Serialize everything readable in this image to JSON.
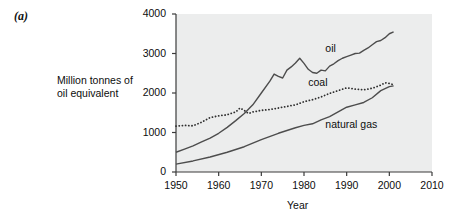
{
  "figure": {
    "panel_letter": "(a)",
    "y_axis_title_line1": "Million tonnes of",
    "y_axis_title_line2": "oil equivalent",
    "x_axis_title": "Year"
  },
  "chart_data": {
    "type": "line",
    "title": "",
    "xlabel": "Year",
    "ylabel": "Million tonnes of oil equivalent",
    "xlim": [
      1950,
      2010
    ],
    "ylim": [
      0,
      4000
    ],
    "xticks": [
      "1950",
      "1960",
      "1970",
      "1980",
      "1990",
      "2000",
      "2010"
    ],
    "yticks": [
      "0",
      "1000",
      "2000",
      "3000",
      "4000"
    ],
    "grid": false,
    "legend_position": "inline-labels",
    "plot_background": "#eceded",
    "series": [
      {
        "name": "oil",
        "label": "oil",
        "style": "solid",
        "color": "#4d4d4d",
        "x": [
          1950,
          1952,
          1954,
          1956,
          1958,
          1960,
          1962,
          1964,
          1966,
          1968,
          1970,
          1972,
          1973,
          1974,
          1975,
          1976,
          1977,
          1978,
          1979,
          1980,
          1981,
          1982,
          1983,
          1984,
          1985,
          1986,
          1987,
          1988,
          1989,
          1990,
          1991,
          1992,
          1993,
          1994,
          1995,
          1996,
          1997,
          1998,
          1999,
          2000,
          2001
        ],
        "values": [
          500,
          580,
          660,
          760,
          860,
          980,
          1130,
          1300,
          1480,
          1700,
          2000,
          2300,
          2480,
          2420,
          2380,
          2580,
          2660,
          2760,
          2880,
          2750,
          2600,
          2520,
          2500,
          2580,
          2560,
          2680,
          2740,
          2820,
          2880,
          2920,
          2960,
          3000,
          3010,
          3080,
          3140,
          3220,
          3300,
          3330,
          3400,
          3500,
          3550
        ]
      },
      {
        "name": "coal",
        "label": "coal",
        "style": "dotted",
        "color": "#2f2f2f",
        "x": [
          1950,
          1952,
          1954,
          1956,
          1958,
          1960,
          1962,
          1964,
          1965,
          1966,
          1967,
          1968,
          1970,
          1972,
          1974,
          1976,
          1978,
          1980,
          1982,
          1984,
          1986,
          1988,
          1990,
          1992,
          1994,
          1996,
          1998,
          1999,
          2000,
          2001
        ],
        "values": [
          1160,
          1180,
          1170,
          1260,
          1380,
          1420,
          1450,
          1520,
          1620,
          1560,
          1480,
          1520,
          1560,
          1580,
          1620,
          1660,
          1700,
          1780,
          1830,
          1900,
          1990,
          2060,
          2130,
          2100,
          2080,
          2120,
          2200,
          2260,
          2240,
          2210
        ]
      },
      {
        "name": "natural gas",
        "label": "natural gas",
        "style": "solid",
        "color": "#4d4d4d",
        "x": [
          1950,
          1954,
          1958,
          1962,
          1966,
          1970,
          1974,
          1978,
          1980,
          1982,
          1984,
          1986,
          1988,
          1990,
          1992,
          1994,
          1996,
          1998,
          2000,
          2001
        ],
        "values": [
          200,
          280,
          380,
          500,
          640,
          820,
          980,
          1120,
          1180,
          1220,
          1320,
          1400,
          1520,
          1640,
          1700,
          1760,
          1880,
          2060,
          2160,
          2180
        ]
      }
    ],
    "annotations": [
      {
        "text": "oil",
        "x": 1985,
        "y": 3120
      },
      {
        "text": "coal",
        "x": 1981,
        "y": 2260
      },
      {
        "text": "natural gas",
        "x": 1985,
        "y": 1200
      }
    ]
  }
}
